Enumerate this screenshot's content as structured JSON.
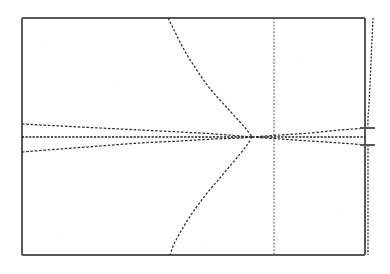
{
  "figure": {
    "title": "",
    "background_color": "#ffffff",
    "border_color": "#585858",
    "trace_color": "#2b2b2b",
    "style": "scanned-dotted-lineplot"
  },
  "chart_data": {
    "type": "line",
    "title": "",
    "xlabel": "",
    "ylabel": "",
    "grid": false,
    "legend": "none",
    "xlim": [
      0,
      390
    ],
    "ylim": [
      274,
      0
    ],
    "axis_note": "pixel coordinates; no tick labels rendered in image",
    "plot_frame": {
      "left": 22,
      "top": 18,
      "right": 365,
      "bottom": 255
    },
    "breakaway_point": {
      "x": 252,
      "y": 137
    },
    "series": [
      {
        "name": "real-axis-locus-horizontal",
        "style": "dotted",
        "points": [
          [
            22,
            137
          ],
          [
            60,
            137
          ],
          [
            100,
            137
          ],
          [
            140,
            137
          ],
          [
            180,
            137
          ],
          [
            215,
            137
          ],
          [
            240,
            137
          ],
          [
            252,
            137
          ],
          [
            275,
            137
          ],
          [
            300,
            137
          ],
          [
            330,
            137
          ],
          [
            365,
            137
          ]
        ]
      },
      {
        "name": "left-upper-asymptote",
        "style": "dotted",
        "points": [
          [
            22,
            124
          ],
          [
            60,
            126
          ],
          [
            100,
            128
          ],
          [
            140,
            130
          ],
          [
            180,
            132
          ],
          [
            215,
            134
          ],
          [
            240,
            136
          ],
          [
            252,
            137
          ]
        ]
      },
      {
        "name": "left-lower-asymptote",
        "style": "dotted",
        "points": [
          [
            22,
            152
          ],
          [
            60,
            149
          ],
          [
            100,
            146
          ],
          [
            140,
            143
          ],
          [
            180,
            141
          ],
          [
            215,
            139
          ],
          [
            240,
            138
          ],
          [
            252,
            137
          ]
        ]
      },
      {
        "name": "right-upper-asymptote",
        "style": "dotted",
        "points": [
          [
            252,
            137
          ],
          [
            280,
            135
          ],
          [
            310,
            133
          ],
          [
            340,
            130
          ],
          [
            368,
            128
          ]
        ]
      },
      {
        "name": "right-lower-asymptote",
        "style": "dotted",
        "points": [
          [
            252,
            137
          ],
          [
            280,
            139
          ],
          [
            310,
            141
          ],
          [
            340,
            143
          ],
          [
            368,
            145
          ]
        ]
      },
      {
        "name": "upper-branch-curve",
        "style": "dotted",
        "points": [
          [
            168,
            18
          ],
          [
            174,
            30
          ],
          [
            181,
            44
          ],
          [
            189,
            58
          ],
          [
            198,
            72
          ],
          [
            208,
            86
          ],
          [
            219,
            99
          ],
          [
            230,
            111
          ],
          [
            240,
            122
          ],
          [
            247,
            130
          ],
          [
            252,
            137
          ]
        ]
      },
      {
        "name": "lower-branch-curve",
        "style": "dotted",
        "points": [
          [
            252,
            137
          ],
          [
            247,
            145
          ],
          [
            240,
            154
          ],
          [
            230,
            166
          ],
          [
            219,
            179
          ],
          [
            208,
            192
          ],
          [
            198,
            205
          ],
          [
            189,
            218
          ],
          [
            181,
            231
          ],
          [
            174,
            244
          ],
          [
            170,
            255
          ]
        ]
      },
      {
        "name": "center-vertical-locus",
        "style": "dotted",
        "points": [
          [
            274,
            18
          ],
          [
            274,
            60
          ],
          [
            274,
            100
          ],
          [
            274,
            137
          ],
          [
            274,
            180
          ],
          [
            274,
            220
          ],
          [
            274,
            255
          ]
        ]
      },
      {
        "name": "right-vertical-locus-upper",
        "style": "dotted",
        "points": [
          [
            373,
            18
          ],
          [
            372,
            40
          ],
          [
            371,
            62
          ],
          [
            370,
            84
          ],
          [
            369,
            104
          ],
          [
            368,
            118
          ],
          [
            368,
            128
          ]
        ]
      },
      {
        "name": "right-vertical-locus-lower",
        "style": "dotted",
        "points": [
          [
            368,
            145
          ],
          [
            368,
            170
          ],
          [
            368,
            200
          ],
          [
            368,
            230
          ],
          [
            368,
            255
          ]
        ]
      },
      {
        "name": "right-upper-stub",
        "style": "solid-short",
        "points": [
          [
            360,
            128
          ],
          [
            375,
            128
          ]
        ]
      },
      {
        "name": "right-lower-stub",
        "style": "solid-short",
        "points": [
          [
            360,
            145
          ],
          [
            375,
            145
          ]
        ]
      }
    ]
  }
}
